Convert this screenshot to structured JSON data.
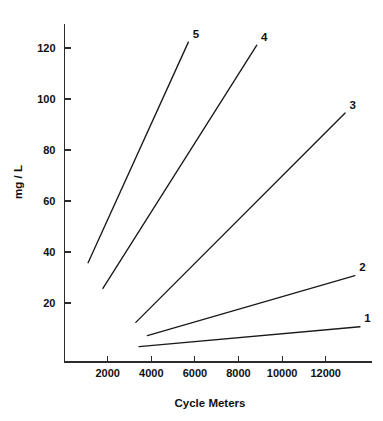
{
  "chart_data": {
    "type": "line",
    "title": "",
    "xlabel": "Cycle Meters",
    "ylabel": "mg / L",
    "xlim": [
      0,
      14400
    ],
    "ylim": [
      0,
      134
    ],
    "grid": false,
    "legend_position": "inline-end-labels",
    "xticks": [
      2000,
      4000,
      6000,
      8000,
      10000,
      12000
    ],
    "xtick_labels": [
      "2000",
      "4000",
      "6000",
      "8000",
      "10000",
      "12000"
    ],
    "yticks": [
      20,
      40,
      60,
      80,
      100,
      120
    ],
    "ytick_labels": [
      "20",
      "40",
      "60",
      "80",
      "100",
      "120"
    ],
    "series": [
      {
        "name": "1",
        "label": "1",
        "x": [
          3440,
          13570
        ],
        "values": [
          2.9,
          10.7
        ]
      },
      {
        "name": "2",
        "label": "2",
        "x": [
          3820,
          13340
        ],
        "values": [
          7.2,
          30.7
        ]
      },
      {
        "name": "3",
        "label": "3",
        "x": [
          3290,
          12890
        ],
        "values": [
          12.4,
          94.5
        ]
      },
      {
        "name": "4",
        "label": "4",
        "x": [
          1780,
          8840
        ],
        "values": [
          25.7,
          121.1
        ]
      },
      {
        "name": "5",
        "label": "5",
        "x": [
          1100,
          5700
        ],
        "values": [
          35.8,
          122.3
        ]
      }
    ]
  },
  "colors": {
    "line": "#1a1a1a",
    "axis": "#2b2b2b",
    "background": "#ffffff"
  }
}
